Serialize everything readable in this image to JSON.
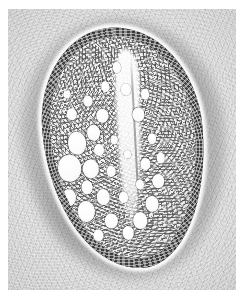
{
  "image": {
    "kind": "electron-micrograph",
    "subject": "bacterial cell cross-section",
    "palette": "grayscale",
    "background_color": "#dcdcdc",
    "cell_wall_color": "#3e3e3e",
    "cytoplasm_color": "#f7f7f7",
    "rim_color": "#fbfbfb",
    "border_color": "#ffffff",
    "visible_text": ""
  },
  "plate": {
    "width": 245,
    "height": 300,
    "margin_left": 8,
    "margin_top": 9,
    "field_width": 228,
    "field_height": 281
  },
  "structures": {
    "halo_label": "",
    "wall_label": "",
    "cytoplasm_label": "",
    "nucleoid_label": ""
  },
  "vesicles": [
    {
      "x": 18,
      "y": 46,
      "d": 13
    },
    {
      "x": 30,
      "y": 42,
      "d": 9
    },
    {
      "x": 11,
      "y": 57,
      "d": 16
    },
    {
      "x": 26,
      "y": 58,
      "d": 11
    },
    {
      "x": 22,
      "y": 66,
      "d": 8
    },
    {
      "x": 9,
      "y": 70,
      "d": 10
    },
    {
      "x": 20,
      "y": 77,
      "d": 12
    },
    {
      "x": 33,
      "y": 71,
      "d": 9
    },
    {
      "x": 16,
      "y": 33,
      "d": 7
    },
    {
      "x": 28,
      "y": 28,
      "d": 6
    },
    {
      "x": 37,
      "y": 35,
      "d": 8
    },
    {
      "x": 41,
      "y": 22,
      "d": 6
    },
    {
      "x": 33,
      "y": 50,
      "d": 7
    },
    {
      "x": 40,
      "y": 60,
      "d": 6
    },
    {
      "x": 37,
      "y": 82,
      "d": 9
    },
    {
      "x": 48,
      "y": 88,
      "d": 8
    },
    {
      "x": 57,
      "y": 83,
      "d": 10
    },
    {
      "x": 66,
      "y": 76,
      "d": 9
    },
    {
      "x": 72,
      "y": 66,
      "d": 8
    },
    {
      "x": 64,
      "y": 58,
      "d": 7
    },
    {
      "x": 70,
      "y": 47,
      "d": 6
    },
    {
      "x": 62,
      "y": 36,
      "d": 8
    },
    {
      "x": 68,
      "y": 27,
      "d": 6
    },
    {
      "x": 55,
      "y": 24,
      "d": 7
    },
    {
      "x": 50,
      "y": 14,
      "d": 6
    },
    {
      "x": 59,
      "y": 67,
      "d": 6
    },
    {
      "x": 47,
      "y": 72,
      "d": 6
    },
    {
      "x": 44,
      "y": 46,
      "d": 5
    },
    {
      "x": 27,
      "y": 88,
      "d": 7
    },
    {
      "x": 52,
      "y": 53,
      "d": 5
    },
    {
      "x": 75,
      "y": 56,
      "d": 6
    },
    {
      "x": 14,
      "y": 24,
      "d": 5
    }
  ]
}
